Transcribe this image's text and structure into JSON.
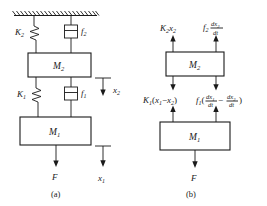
{
  "figure": {
    "panels": [
      {
        "caption": "(a)",
        "type": "schematic",
        "description": "Two-mass spring-damper system suspended from a fixed hatched ceiling",
        "masses": [
          {
            "label": "M",
            "sub": "2"
          },
          {
            "label": "M",
            "sub": "1"
          }
        ],
        "springs": [
          {
            "label": "K",
            "sub": "2"
          },
          {
            "label": "K",
            "sub": "1"
          }
        ],
        "dampers": [
          {
            "label": "f",
            "sub": "2"
          },
          {
            "label": "f",
            "sub": "1"
          }
        ],
        "force": {
          "label": "F"
        },
        "displacements": [
          {
            "label": "x",
            "sub": "2"
          },
          {
            "label": "x",
            "sub": "1"
          }
        ]
      },
      {
        "caption": "(b)",
        "type": "free-body",
        "description": "Free-body diagrams for the two masses",
        "masses": [
          {
            "label": "M",
            "sub": "2"
          },
          {
            "label": "M",
            "sub": "1"
          }
        ],
        "forces_on_m2_top": [
          {
            "coef": "K",
            "coefsub": "2",
            "var": "x",
            "varsub": "2"
          },
          {
            "coef": "f",
            "coefsub": "2",
            "numer": "dx",
            "numersub": "2",
            "denom": "dt"
          }
        ],
        "forces_on_m2_bottom": [
          {
            "expr": "K",
            "sub": "1",
            "body": "(x",
            "body2": "1",
            "body3": "− x",
            "body4": "2",
            "body5": ")"
          },
          {
            "expr": "f",
            "sub": "1"
          }
        ],
        "spring_force_lower": {
          "coef": "K",
          "coefsub": "1",
          "open": "(",
          "t1": "x",
          "t1sub": "1",
          "minus": "−",
          "t2": "x",
          "t2sub": "2",
          "close": ")"
        },
        "damper_force_lower": {
          "coef": "f",
          "coefsub": "1",
          "open": "(",
          "n1": "dx",
          "n1sub": "1",
          "d1": "dt",
          "minus": "−",
          "n2": "dx",
          "n2sub": "2",
          "d2": "dt",
          "close": ")"
        },
        "force": {
          "label": "F"
        }
      }
    ],
    "colors": {
      "ink": "#1a1a1a",
      "paper": "#ffffff"
    }
  }
}
